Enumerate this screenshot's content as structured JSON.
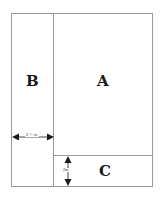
{
  "diagram": {
    "regions": [
      {
        "id": "A",
        "label": "A"
      },
      {
        "id": "B",
        "label": "B"
      },
      {
        "id": "C",
        "label": "C"
      }
    ],
    "dimensions": {
      "b_width": "2 ½ in.",
      "c_height": "2in."
    },
    "colors": {
      "line": "#9a9a9a",
      "text": "#1a1a1a",
      "background": "#ffffff"
    }
  }
}
